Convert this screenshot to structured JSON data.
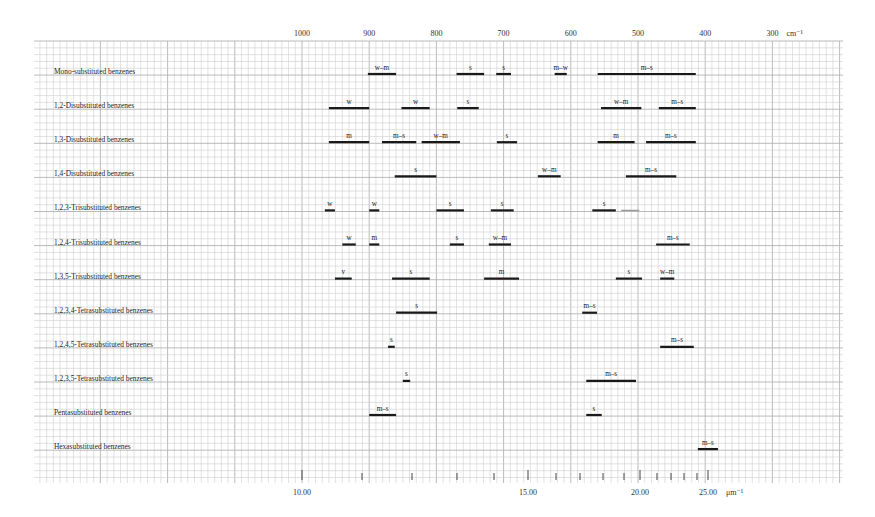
{
  "chart_data": {
    "type": "range-bar",
    "title": "",
    "top_axis": {
      "label_unit": "cm⁻¹",
      "ticks": [
        1000,
        900,
        800,
        700,
        600,
        500,
        400,
        300
      ],
      "range": [
        1000,
        300
      ]
    },
    "bottom_axis": {
      "label_unit": "μm⁻¹",
      "ticks_labeled": [
        "10.00",
        "15.00",
        "20.00",
        "25.00"
      ],
      "ticks_labeled_values": [
        10.0,
        15.0,
        20.0,
        25.0
      ]
    },
    "grid": true,
    "rows": [
      {
        "label": "Mono-substituted benzenes",
        "bands": [
          {
            "from": 902,
            "to": 860,
            "intensity": "w–m"
          },
          {
            "from": 770,
            "to": 729,
            "intensity": "s"
          },
          {
            "from": 711,
            "to": 689,
            "intensity": "s"
          },
          {
            "from": 624,
            "to": 606,
            "intensity": "m–w"
          },
          {
            "from": 560,
            "to": 414,
            "intensity": "m–s"
          }
        ]
      },
      {
        "label": "1,2-Disubstituted benzenes",
        "bands": [
          {
            "from": 960,
            "to": 900,
            "intensity": "w"
          },
          {
            "from": 852,
            "to": 810,
            "intensity": "w"
          },
          {
            "from": 769,
            "to": 737,
            "intensity": "s"
          },
          {
            "from": 555,
            "to": 495,
            "intensity": "w–m"
          },
          {
            "from": 469,
            "to": 414,
            "intensity": "m–s"
          }
        ]
      },
      {
        "label": "1,3-Disubstituted benzenes",
        "bands": [
          {
            "from": 960,
            "to": 900,
            "intensity": "m"
          },
          {
            "from": 881,
            "to": 830,
            "intensity": "m–s"
          },
          {
            "from": 822,
            "to": 765,
            "intensity": "w–m"
          },
          {
            "from": 710,
            "to": 680,
            "intensity": "s"
          },
          {
            "from": 560,
            "to": 505,
            "intensity": "m"
          },
          {
            "from": 488,
            "to": 414,
            "intensity": "m–s"
          }
        ]
      },
      {
        "label": "1,4-Disubstituted benzenes",
        "bands": [
          {
            "from": 862,
            "to": 800,
            "intensity": "s"
          },
          {
            "from": 649,
            "to": 615,
            "intensity": "w–m"
          },
          {
            "from": 518,
            "to": 443,
            "intensity": "m–s"
          }
        ]
      },
      {
        "label": "1,2,3-Trisubstituted benzenes",
        "bands": [
          {
            "from": 966,
            "to": 951,
            "intensity": "w"
          },
          {
            "from": 900,
            "to": 885,
            "intensity": "w"
          },
          {
            "from": 800,
            "to": 759,
            "intensity": "s"
          },
          {
            "from": 719,
            "to": 685,
            "intensity": "s"
          },
          {
            "from": 568,
            "to": 533,
            "intensity": "s"
          },
          {
            "from": 525,
            "to": 498,
            "intensity": "",
            "faint": true
          }
        ]
      },
      {
        "label": "1,2,4-Trisubstituted benzenes",
        "bands": [
          {
            "from": 940,
            "to": 920,
            "intensity": "w"
          },
          {
            "from": 900,
            "to": 885,
            "intensity": "m"
          },
          {
            "from": 780,
            "to": 759,
            "intensity": "s"
          },
          {
            "from": 722,
            "to": 689,
            "intensity": "w–m"
          },
          {
            "from": 473,
            "to": 423,
            "intensity": "m–s"
          }
        ]
      },
      {
        "label": "1,3,5-Trisubstituted benzenes",
        "bands": [
          {
            "from": 951,
            "to": 926,
            "intensity": "v"
          },
          {
            "from": 866,
            "to": 810,
            "intensity": "s"
          },
          {
            "from": 729,
            "to": 677,
            "intensity": "m"
          },
          {
            "from": 533,
            "to": 494,
            "intensity": "s"
          },
          {
            "from": 467,
            "to": 446,
            "intensity": "w–m"
          }
        ]
      },
      {
        "label": "1,2,3,4-Tetrasubstituted benzenes",
        "bands": [
          {
            "from": 860,
            "to": 799,
            "intensity": "s"
          },
          {
            "from": 583,
            "to": 561,
            "intensity": "m–s"
          }
        ]
      },
      {
        "label": "1,2,4,5-Tetrasubstituted benzenes",
        "bands": [
          {
            "from": 872,
            "to": 862,
            "intensity": "s"
          },
          {
            "from": 467,
            "to": 417,
            "intensity": "m–s"
          }
        ]
      },
      {
        "label": "1,2,3,5-Tetrasubstituted benzenes",
        "bands": [
          {
            "from": 850,
            "to": 839,
            "intensity": "s"
          },
          {
            "from": 577,
            "to": 503,
            "intensity": "m–s"
          }
        ]
      },
      {
        "label": "Pentasubstituted benzenes",
        "bands": [
          {
            "from": 900,
            "to": 860,
            "intensity": "m–s"
          },
          {
            "from": 577,
            "to": 554,
            "intensity": "s"
          }
        ]
      },
      {
        "label": "Hexasubstituted benzenes",
        "bands": [
          {
            "from": 411,
            "to": 381,
            "intensity": "m–s"
          }
        ]
      }
    ]
  },
  "layout": {
    "grid_left": 34,
    "grid_right": 843,
    "grid_top": 41,
    "grid_bottom": 483,
    "x_at_1000": 302,
    "px_per_wavenumber": 0.672,
    "row_first_y": 74,
    "row_step": 34.1,
    "bottom_ticks_x": [
      302,
      362,
      412,
      457,
      494,
      528,
      556,
      580,
      603,
      624,
      640,
      657,
      671,
      684,
      697,
      708
    ],
    "bottom_ticks_major_x": [
      302,
      528,
      640,
      708
    ]
  }
}
